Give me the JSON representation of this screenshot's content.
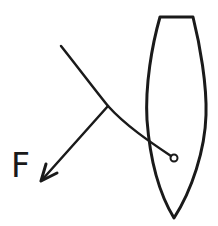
{
  "diagram": {
    "labels": {
      "force": "F"
    },
    "elements": [
      {
        "id": "hull",
        "kind": "boat-hull-outline"
      },
      {
        "id": "sail",
        "kind": "curved-sail-line"
      },
      {
        "id": "mast",
        "kind": "pivot-circle"
      },
      {
        "id": "force-arrow",
        "kind": "arrow",
        "label": "F"
      }
    ],
    "colors": {
      "ink": "#1a1a1a",
      "background": "#ffffff"
    }
  }
}
